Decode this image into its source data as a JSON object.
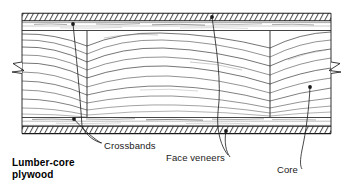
{
  "figure": {
    "name": "lumber-core-plywood-cutaway",
    "title": "Lumber-core\nplywood",
    "ink_color": "#1a1a1a",
    "background_color": "#ffffff"
  },
  "callouts": [
    {
      "id": "crossbands",
      "label": "Crossbands",
      "marker_count": 2,
      "markers": [
        {
          "x": 73,
          "y": 24
        },
        {
          "x": 74,
          "y": 119
        }
      ]
    },
    {
      "id": "face-veneers",
      "label": "Face veneers",
      "marker_count": 2,
      "markers": [
        {
          "x": 212,
          "y": 17
        },
        {
          "x": 226,
          "y": 131
        }
      ]
    },
    {
      "id": "core",
      "label": "Core",
      "marker_count": 1,
      "markers": [
        {
          "x": 310,
          "y": 87
        }
      ]
    }
  ],
  "layers": [
    {
      "name": "face-veneer-top",
      "y_top": 13,
      "y_bottom": 21,
      "hatched": true
    },
    {
      "name": "crossband-top",
      "y_top": 21,
      "y_bottom": 31,
      "hatched": false
    },
    {
      "name": "core",
      "y_top": 31,
      "y_bottom": 117,
      "hatched": false
    },
    {
      "name": "crossband-bottom",
      "y_top": 117,
      "y_bottom": 126,
      "hatched": false
    },
    {
      "name": "face-veneer-bottom",
      "y_top": 126,
      "y_bottom": 134,
      "hatched": true
    }
  ],
  "core_strip_dividers": [
    87,
    270
  ],
  "break_symbols": [
    {
      "name": "break-left",
      "x": 14,
      "y": 67
    },
    {
      "name": "break-right",
      "x": 340,
      "y": 68
    }
  ]
}
